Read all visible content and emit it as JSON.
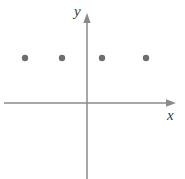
{
  "figure": {
    "width": 185,
    "height": 179,
    "background_color": "#ffffff",
    "axis_color": "#8a8a8a",
    "axis_stroke_width": 1.5,
    "point_color": "#6e6e6e",
    "point_radius": 3.2,
    "label_color": "#3a3a3a",
    "origin_px": {
      "x": 87,
      "y": 103
    },
    "unit_px": 40
  },
  "axes": {
    "x": {
      "label": "x",
      "start_px": {
        "x": 4,
        "y": 103
      },
      "end_px": {
        "x": 176,
        "y": 103
      },
      "has_arrow": true,
      "arrow_at": "end"
    },
    "y": {
      "label": "y",
      "start_px": {
        "x": 87,
        "y": 179
      },
      "end_px": {
        "x": 87,
        "y": 13
      },
      "has_arrow": true,
      "arrow_at": "end"
    }
  },
  "chart_data": {
    "type": "scatter",
    "title": "",
    "subtitle": "",
    "xlabel": "x",
    "ylabel": "y",
    "grid": false,
    "legend": false,
    "legend_position": "none",
    "xlim": [
      -2.075,
      2.225
    ],
    "ylim": [
      -1.9,
      2.25
    ],
    "xticks": [],
    "yticks": [],
    "xticklabels": [],
    "yticklabels": [],
    "annotations": [],
    "series": [
      {
        "name": "points",
        "marker": "circle",
        "color": "#6e6e6e",
        "x": [
          -1.55,
          -0.63,
          0.38,
          1.48
        ],
        "y": [
          1.13,
          1.13,
          1.13,
          1.13
        ],
        "points_px": [
          {
            "x": 25,
            "y": 58
          },
          {
            "x": 62,
            "y": 58
          },
          {
            "x": 102,
            "y": 58
          },
          {
            "x": 146,
            "y": 58
          }
        ]
      }
    ]
  }
}
